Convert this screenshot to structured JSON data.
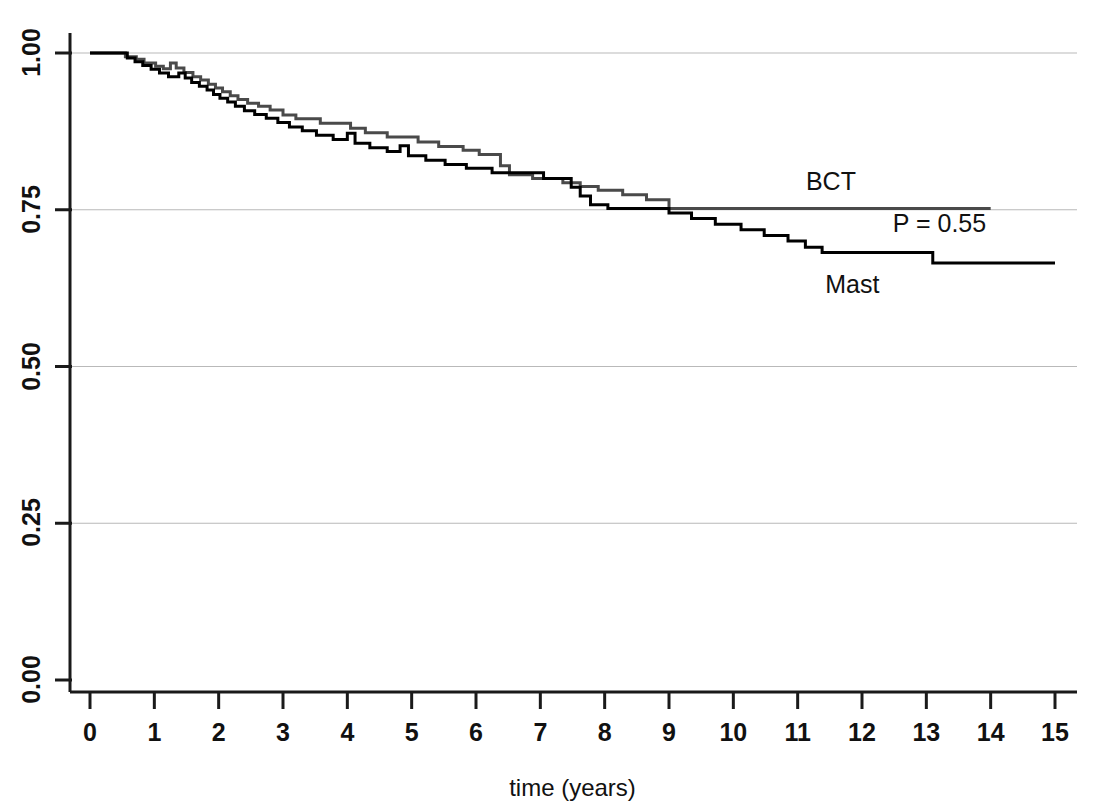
{
  "chart_data": {
    "type": "line",
    "subtype": "kaplan-meier-step",
    "title": "",
    "xlabel": "time (years)",
    "ylabel": "",
    "xlim": [
      0,
      15
    ],
    "ylim": [
      0.0,
      1.0
    ],
    "grid": true,
    "gridlines_y": [
      0.0,
      0.25,
      0.5,
      0.75,
      1.0
    ],
    "legend_position": "inline-annotation",
    "x_ticks": [
      "0",
      "1",
      "2",
      "3",
      "4",
      "5",
      "6",
      "7",
      "8",
      "9",
      "10",
      "11",
      "12",
      "13",
      "14",
      "15"
    ],
    "x_tick_values": [
      0,
      1,
      2,
      3,
      4,
      5,
      6,
      7,
      8,
      9,
      10,
      11,
      12,
      13,
      14,
      15
    ],
    "y_ticks": [
      "0.00",
      "0.25",
      "0.50",
      "0.75",
      "1.00"
    ],
    "y_tick_values": [
      0.0,
      0.25,
      0.5,
      0.75,
      1.0
    ],
    "annotations": [
      {
        "name": "bct-label",
        "text": "BCT",
        "x": 11.75,
        "y": 0.795
      },
      {
        "name": "pvalue-label",
        "text": "P = 0.55",
        "x": 13.1,
        "y": 0.728
      },
      {
        "name": "mast-label",
        "text": "Mast",
        "x": 12.05,
        "y": 0.63
      }
    ],
    "series": [
      {
        "name": "BCT",
        "label": "BCT",
        "color": "#4a4a4a",
        "linewidth": 3,
        "final_value": 0.752,
        "final_time": 14.0,
        "points": [
          [
            0.0,
            1.0
          ],
          [
            0.55,
            1.0
          ],
          [
            0.55,
            0.994
          ],
          [
            0.72,
            0.994
          ],
          [
            0.72,
            0.99
          ],
          [
            0.84,
            0.99
          ],
          [
            0.84,
            0.984
          ],
          [
            1.02,
            0.984
          ],
          [
            1.02,
            0.979
          ],
          [
            1.14,
            0.979
          ],
          [
            1.14,
            0.975
          ],
          [
            1.25,
            0.975
          ],
          [
            1.25,
            0.984
          ],
          [
            1.34,
            0.984
          ],
          [
            1.34,
            0.976
          ],
          [
            1.46,
            0.976
          ],
          [
            1.46,
            0.969
          ],
          [
            1.6,
            0.969
          ],
          [
            1.6,
            0.962
          ],
          [
            1.72,
            0.962
          ],
          [
            1.72,
            0.957
          ],
          [
            1.84,
            0.957
          ],
          [
            1.84,
            0.95
          ],
          [
            1.95,
            0.95
          ],
          [
            1.95,
            0.944
          ],
          [
            2.06,
            0.944
          ],
          [
            2.06,
            0.938
          ],
          [
            2.18,
            0.938
          ],
          [
            2.18,
            0.932
          ],
          [
            2.3,
            0.932
          ],
          [
            2.3,
            0.926
          ],
          [
            2.45,
            0.926
          ],
          [
            2.45,
            0.92
          ],
          [
            2.62,
            0.92
          ],
          [
            2.62,
            0.915
          ],
          [
            2.8,
            0.915
          ],
          [
            2.8,
            0.909
          ],
          [
            3.0,
            0.909
          ],
          [
            3.0,
            0.901
          ],
          [
            3.2,
            0.901
          ],
          [
            3.2,
            0.895
          ],
          [
            3.58,
            0.895
          ],
          [
            3.58,
            0.888
          ],
          [
            4.05,
            0.888
          ],
          [
            4.05,
            0.88
          ],
          [
            4.28,
            0.88
          ],
          [
            4.28,
            0.873
          ],
          [
            4.62,
            0.873
          ],
          [
            4.62,
            0.866
          ],
          [
            5.1,
            0.866
          ],
          [
            5.1,
            0.858
          ],
          [
            5.42,
            0.858
          ],
          [
            5.42,
            0.851
          ],
          [
            5.8,
            0.851
          ],
          [
            5.8,
            0.845
          ],
          [
            6.05,
            0.845
          ],
          [
            6.05,
            0.838
          ],
          [
            6.38,
            0.838
          ],
          [
            6.38,
            0.82
          ],
          [
            6.52,
            0.82
          ],
          [
            6.52,
            0.806
          ],
          [
            6.88,
            0.806
          ],
          [
            6.88,
            0.8
          ],
          [
            7.35,
            0.8
          ],
          [
            7.35,
            0.793
          ],
          [
            7.62,
            0.793
          ],
          [
            7.62,
            0.787
          ],
          [
            7.9,
            0.787
          ],
          [
            7.9,
            0.781
          ],
          [
            8.28,
            0.781
          ],
          [
            8.28,
            0.774
          ],
          [
            8.65,
            0.774
          ],
          [
            8.65,
            0.766
          ],
          [
            9.0,
            0.766
          ],
          [
            9.0,
            0.752
          ],
          [
            14.0,
            0.752
          ]
        ]
      },
      {
        "name": "Mast",
        "label": "Mast",
        "color": "#000000",
        "linewidth": 3,
        "final_value": 0.665,
        "final_time": 15.0,
        "points": [
          [
            0.0,
            1.0
          ],
          [
            0.58,
            1.0
          ],
          [
            0.58,
            0.992
          ],
          [
            0.7,
            0.992
          ],
          [
            0.7,
            0.986
          ],
          [
            0.82,
            0.986
          ],
          [
            0.82,
            0.98
          ],
          [
            0.95,
            0.98
          ],
          [
            0.95,
            0.974
          ],
          [
            1.08,
            0.974
          ],
          [
            1.08,
            0.968
          ],
          [
            1.22,
            0.968
          ],
          [
            1.22,
            0.962
          ],
          [
            1.38,
            0.962
          ],
          [
            1.38,
            0.968
          ],
          [
            1.48,
            0.968
          ],
          [
            1.48,
            0.96
          ],
          [
            1.58,
            0.96
          ],
          [
            1.58,
            0.953
          ],
          [
            1.7,
            0.953
          ],
          [
            1.7,
            0.947
          ],
          [
            1.82,
            0.947
          ],
          [
            1.82,
            0.941
          ],
          [
            1.92,
            0.941
          ],
          [
            1.92,
            0.934
          ],
          [
            2.02,
            0.934
          ],
          [
            2.02,
            0.928
          ],
          [
            2.14,
            0.928
          ],
          [
            2.14,
            0.922
          ],
          [
            2.26,
            0.922
          ],
          [
            2.26,
            0.915
          ],
          [
            2.4,
            0.915
          ],
          [
            2.4,
            0.908
          ],
          [
            2.56,
            0.908
          ],
          [
            2.56,
            0.902
          ],
          [
            2.74,
            0.902
          ],
          [
            2.74,
            0.896
          ],
          [
            2.92,
            0.896
          ],
          [
            2.92,
            0.889
          ],
          [
            3.1,
            0.889
          ],
          [
            3.1,
            0.882
          ],
          [
            3.3,
            0.882
          ],
          [
            3.3,
            0.876
          ],
          [
            3.52,
            0.876
          ],
          [
            3.52,
            0.869
          ],
          [
            3.78,
            0.869
          ],
          [
            3.78,
            0.862
          ],
          [
            4.0,
            0.862
          ],
          [
            4.0,
            0.872
          ],
          [
            4.12,
            0.872
          ],
          [
            4.12,
            0.856
          ],
          [
            4.35,
            0.856
          ],
          [
            4.35,
            0.849
          ],
          [
            4.62,
            0.849
          ],
          [
            4.62,
            0.843
          ],
          [
            4.82,
            0.843
          ],
          [
            4.82,
            0.852
          ],
          [
            4.95,
            0.852
          ],
          [
            4.95,
            0.836
          ],
          [
            5.22,
            0.836
          ],
          [
            5.22,
            0.829
          ],
          [
            5.52,
            0.829
          ],
          [
            5.52,
            0.822
          ],
          [
            5.85,
            0.822
          ],
          [
            5.85,
            0.816
          ],
          [
            6.25,
            0.816
          ],
          [
            6.25,
            0.809
          ],
          [
            7.05,
            0.809
          ],
          [
            7.05,
            0.8
          ],
          [
            7.48,
            0.8
          ],
          [
            7.48,
            0.786
          ],
          [
            7.62,
            0.786
          ],
          [
            7.62,
            0.772
          ],
          [
            7.78,
            0.772
          ],
          [
            7.78,
            0.758
          ],
          [
            8.05,
            0.758
          ],
          [
            8.05,
            0.752
          ],
          [
            9.0,
            0.752
          ],
          [
            9.0,
            0.745
          ],
          [
            9.35,
            0.745
          ],
          [
            9.35,
            0.736
          ],
          [
            9.72,
            0.736
          ],
          [
            9.72,
            0.727
          ],
          [
            10.12,
            0.727
          ],
          [
            10.12,
            0.718
          ],
          [
            10.48,
            0.718
          ],
          [
            10.48,
            0.709
          ],
          [
            10.85,
            0.709
          ],
          [
            10.85,
            0.7
          ],
          [
            11.12,
            0.7
          ],
          [
            11.12,
            0.69
          ],
          [
            11.38,
            0.69
          ],
          [
            11.38,
            0.682
          ],
          [
            13.1,
            0.682
          ],
          [
            13.1,
            0.665
          ],
          [
            15.0,
            0.665
          ]
        ]
      }
    ]
  },
  "axes": {
    "x_axis_name": "time-axis",
    "y_axis_name": "survival-probability-axis"
  }
}
